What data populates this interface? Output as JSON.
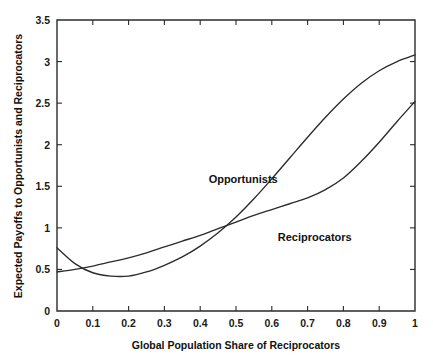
{
  "chart_data": {
    "type": "line",
    "title": "",
    "xlabel": "Global Population Share of Reciprocators",
    "ylabel": "Expected Payoffs to Opportunists and Reciprocators",
    "xlim": [
      0,
      1
    ],
    "ylim": [
      0,
      3.5
    ],
    "grid": false,
    "legend_position": "inline-annotations",
    "xticks": [
      0,
      0.1,
      0.2,
      0.3,
      0.4,
      0.5,
      0.6,
      0.7,
      0.8,
      0.9,
      1
    ],
    "xtick_labels": [
      "0",
      "0.1",
      "0.2",
      "0.3",
      "0.4",
      "0.5",
      "0.6",
      "0.7",
      "0.8",
      "0.9",
      "1"
    ],
    "yticks": [
      0,
      0.5,
      1,
      1.5,
      2,
      2.5,
      3,
      3.5
    ],
    "ytick_labels": [
      "0",
      "0.5",
      "1",
      "1.5",
      "2",
      "2.5",
      "3",
      "3.5"
    ],
    "x": [
      0,
      0.05,
      0.1,
      0.15,
      0.2,
      0.25,
      0.3,
      0.35,
      0.4,
      0.45,
      0.5,
      0.55,
      0.6,
      0.65,
      0.7,
      0.75,
      0.8,
      0.85,
      0.9,
      0.95,
      1
    ],
    "series": [
      {
        "name": "Opportunists",
        "label_x": 0.52,
        "label_y": 1.54,
        "values": [
          0.76,
          0.57,
          0.46,
          0.42,
          0.42,
          0.47,
          0.55,
          0.65,
          0.78,
          0.94,
          1.13,
          1.35,
          1.59,
          1.84,
          2.09,
          2.33,
          2.55,
          2.74,
          2.89,
          3.0,
          3.08
        ]
      },
      {
        "name": "Reciprocators",
        "label_x": 0.72,
        "label_y": 0.84,
        "values": [
          0.47,
          0.5,
          0.54,
          0.59,
          0.64,
          0.7,
          0.77,
          0.84,
          0.91,
          0.99,
          1.07,
          1.15,
          1.22,
          1.29,
          1.36,
          1.46,
          1.6,
          1.8,
          2.03,
          2.28,
          2.52
        ]
      }
    ],
    "annotations": [
      {
        "text": "Opportunists",
        "x": 0.52,
        "y": 1.54
      },
      {
        "text": "Reciprocators",
        "x": 0.72,
        "y": 0.84
      }
    ]
  },
  "colors": {
    "curve": "#2b2b2b",
    "axis": "#2b2b2b",
    "text": "#111111",
    "background": "#ffffff"
  }
}
